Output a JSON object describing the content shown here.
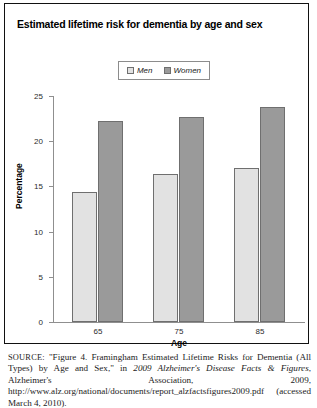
{
  "figure": {
    "title": "Estimated lifetime risk for dementia by age and sex"
  },
  "legend": {
    "position": "top-center",
    "entries": [
      {
        "label": "Men",
        "color": "#e2e2e2"
      },
      {
        "label": "Women",
        "color": "#9a9a9a"
      }
    ]
  },
  "axes": {
    "ylabel": "Percentage",
    "xlabel": "Age",
    "yticks": [
      "25",
      "20",
      "15",
      "10",
      "5",
      "0"
    ],
    "xticks": [
      "65",
      "75",
      "85"
    ]
  },
  "chart_data": {
    "type": "bar",
    "title": "Estimated lifetime risk for dementia by age and sex",
    "xlabel": "Age",
    "ylabel": "Percentage",
    "categories": [
      "65",
      "75",
      "85"
    ],
    "series": [
      {
        "name": "Men",
        "values": [
          14.3,
          16.3,
          17.0
        ],
        "color": "#e2e2e2"
      },
      {
        "name": "Women",
        "values": [
          22.1,
          22.6,
          23.7
        ],
        "color": "#9a9a9a"
      }
    ],
    "ylim": [
      0,
      25
    ],
    "ytick_step": 5,
    "grid": false,
    "legend_position": "top-center"
  },
  "source": {
    "label": "SOURCE:",
    "part1": " \"Figure 4. Framingham Estimated Lifetime Risks for Dementia (All Types) by Age and Sex,\" in ",
    "italic1": "2009 Alzheimer's Disease Facts & Figures",
    "part2": ", Alzheimer's Association, 2009, http://www.alz.org/national/documents/report_alzfactsfigures2009.pdf (accessed March 4, 2010).",
    "clipped_line": "© 2010 Alzheimer's Association. All rights reserved. This is an official"
  }
}
